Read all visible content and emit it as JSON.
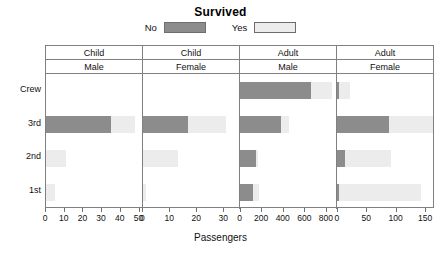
{
  "key": {
    "title": "Survived",
    "items": [
      {
        "label": "No",
        "color": "#8c8c8c"
      },
      {
        "label": "Yes",
        "color": "#ececec"
      }
    ]
  },
  "axis": {
    "xlabel": "Passengers",
    "ylabels": [
      "Crew",
      "3rd",
      "2nd",
      "1st"
    ]
  },
  "chart_data": {
    "type": "bar",
    "title": "Survived",
    "xlabel": "Passengers",
    "ylabel": "",
    "orientation": "horizontal",
    "stacked": true,
    "legend": [
      "No",
      "Yes"
    ],
    "legend_position": "top-center",
    "grid": false,
    "row_categories": [
      "Crew",
      "3rd",
      "2nd",
      "1st"
    ],
    "panels": [
      {
        "age": "Child",
        "sex": "Male",
        "xlim": [
          0,
          52
        ],
        "xticks": [
          0,
          10,
          20,
          30,
          40,
          50
        ],
        "series": [
          {
            "name": "No",
            "values": [
              0,
              35,
              0,
              0
            ]
          },
          {
            "name": "Yes",
            "values": [
              0,
              13,
              11,
              5
            ]
          }
        ]
      },
      {
        "age": "Child",
        "sex": "Female",
        "xlim": [
          0,
          36
        ],
        "xticks": [
          0,
          10,
          20,
          30
        ],
        "series": [
          {
            "name": "No",
            "values": [
              0,
              17,
              0,
              0
            ]
          },
          {
            "name": "Yes",
            "values": [
              0,
              14,
              13,
              1
            ]
          }
        ]
      },
      {
        "age": "Adult",
        "sex": "Male",
        "xlim": [
          0,
          900
        ],
        "xticks": [
          0,
          200,
          400,
          600,
          800
        ],
        "series": [
          {
            "name": "No",
            "values": [
              670,
              387,
              154,
              118
            ]
          },
          {
            "name": "Yes",
            "values": [
              192,
              75,
              14,
              57
            ]
          }
        ]
      },
      {
        "age": "Adult",
        "sex": "Female",
        "xlim": [
          0,
          165
        ],
        "xticks": [
          0,
          50,
          100,
          150
        ],
        "series": [
          {
            "name": "No",
            "values": [
              3,
              89,
              13,
              4
            ]
          },
          {
            "name": "Yes",
            "values": [
              20,
              76,
              80,
              140
            ]
          }
        ]
      }
    ]
  }
}
